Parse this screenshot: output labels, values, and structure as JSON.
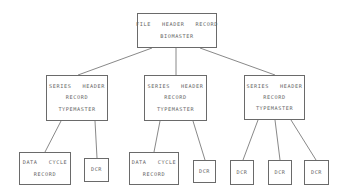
{
  "diagram": {
    "type": "hierarchy",
    "line_color": "#6a6a6a",
    "root": {
      "id": "file-header",
      "lines": [
        "FILE   HEADER   RECORD",
        "BIOMASTER"
      ],
      "box": [
        137,
        13,
        80,
        35
      ]
    },
    "series": [
      {
        "id": "series-1",
        "lines": [
          "SERIES   HEADER",
          "RECORD",
          "TYPEMASTER"
        ],
        "box": [
          46,
          75,
          62,
          46
        ],
        "children": [
          {
            "id": "dcr-1-1",
            "lines": [
              "DATA   CYCLE",
              "RECORD"
            ],
            "box": [
              19,
              152,
              52,
              33
            ]
          },
          {
            "id": "dcr-1-2",
            "lines": [
              "DCR"
            ],
            "box": [
              84,
              158,
              25,
              24
            ]
          }
        ]
      },
      {
        "id": "series-2",
        "lines": [
          "SERIES   HEADER",
          "RECORD",
          "TYPEMASTER"
        ],
        "box": [
          144,
          75,
          63,
          46
        ],
        "children": [
          {
            "id": "dcr-2-1",
            "lines": [
              "DATA   CYCLE",
              "RECORD"
            ],
            "box": [
              129,
              152,
              50,
              33
            ]
          },
          {
            "id": "dcr-2-2",
            "lines": [
              "DCR"
            ],
            "box": [
              193,
              160,
              23,
              23
            ]
          }
        ]
      },
      {
        "id": "series-3",
        "lines": [
          "SERIES   HEADER",
          "RECORD",
          "TYPEMASTER"
        ],
        "box": [
          244,
          75,
          61,
          45
        ],
        "children": [
          {
            "id": "dcr-3-1",
            "lines": [
              "DCR"
            ],
            "box": [
              230,
              160,
              24,
              25
            ]
          },
          {
            "id": "dcr-3-2",
            "lines": [
              "DCR"
            ],
            "box": [
              268,
              160,
              24,
              25
            ]
          },
          {
            "id": "dcr-3-3",
            "lines": [
              "DCR"
            ],
            "box": [
              304,
              160,
              25,
              25
            ]
          }
        ]
      }
    ],
    "edges": [
      [
        152,
        48,
        78,
        75
      ],
      [
        176,
        48,
        176,
        75
      ],
      [
        200,
        48,
        275,
        75
      ],
      [
        61,
        121,
        45,
        152
      ],
      [
        95,
        121,
        97,
        158
      ],
      [
        160,
        121,
        154,
        152
      ],
      [
        193,
        121,
        205,
        160
      ],
      [
        258,
        120,
        243,
        160
      ],
      [
        275,
        120,
        280,
        160
      ],
      [
        291,
        120,
        316,
        160
      ]
    ]
  }
}
